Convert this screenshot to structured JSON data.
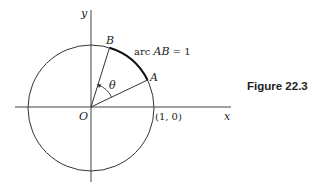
{
  "figure": {
    "caption": "Figure 22.3",
    "labels": {
      "y_axis": "y",
      "x_axis": "x",
      "origin": "O",
      "point_a": "A",
      "point_b": "B",
      "angle": "θ",
      "unit_point": "(1, 0)",
      "arc_prefix": "arc ",
      "arc_name": "AB",
      "arc_value": " = 1"
    },
    "colors": {
      "stroke": "#333333",
      "arc": "#111111"
    }
  }
}
